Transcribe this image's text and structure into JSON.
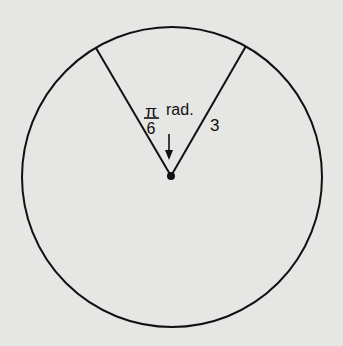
{
  "diagram": {
    "type": "circle-sector",
    "angle_label": {
      "numerator": "π",
      "denominator": "6",
      "unit": "rad."
    },
    "radius_label": "3",
    "colors": {
      "background": "#e6e6e4",
      "stroke": "#111111"
    }
  }
}
